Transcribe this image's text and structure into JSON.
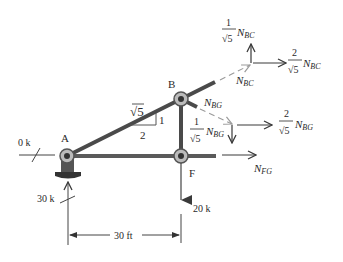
{
  "diagram": {
    "type": "truss free-body diagram",
    "joints": {
      "A": {
        "label": "A"
      },
      "B": {
        "label": "B"
      },
      "F": {
        "label": "F"
      }
    },
    "slope": {
      "hyp": "√5",
      "rise": "1",
      "run": "2"
    },
    "loads": {
      "horizontal_reaction_A": "0 k",
      "vertical_reaction_A": "30 k",
      "load_F": "20 k"
    },
    "dimension": {
      "label": "30 ft"
    },
    "forces": {
      "N_BC": {
        "sym": "N",
        "sub": "BC"
      },
      "N_BC_vertical": {
        "num": "1",
        "den": "√5",
        "sym": "N",
        "sub": "BC"
      },
      "N_BC_horizontal": {
        "num": "2",
        "den": "√5",
        "sym": "N",
        "sub": "BC"
      },
      "N_BG": {
        "sym": "N",
        "sub": "BG"
      },
      "N_BG_vertical": {
        "num": "1",
        "den": "√5",
        "sym": "N",
        "sub": "BG"
      },
      "N_BG_horizontal": {
        "num": "2",
        "den": "√5",
        "sym": "N",
        "sub": "BG"
      },
      "N_FG": {
        "sym": "N",
        "sub": "FG"
      }
    },
    "colors": {
      "member": "#4a4a4a",
      "dashed": "#9a9a9a",
      "arrow": "#3a3a3a",
      "text": "#2a2a2a"
    }
  }
}
